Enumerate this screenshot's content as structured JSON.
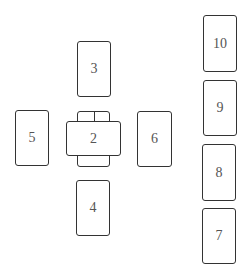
{
  "diagram": {
    "title": "",
    "cards": [
      {
        "id": "1",
        "label": "1"
      },
      {
        "id": "2",
        "label": "2"
      },
      {
        "id": "3",
        "label": "3"
      },
      {
        "id": "4",
        "label": "4"
      },
      {
        "id": "5",
        "label": "5"
      },
      {
        "id": "6",
        "label": "6"
      },
      {
        "id": "7",
        "label": "7"
      },
      {
        "id": "8",
        "label": "8"
      },
      {
        "id": "9",
        "label": "9"
      },
      {
        "id": "10",
        "label": "10"
      }
    ]
  }
}
